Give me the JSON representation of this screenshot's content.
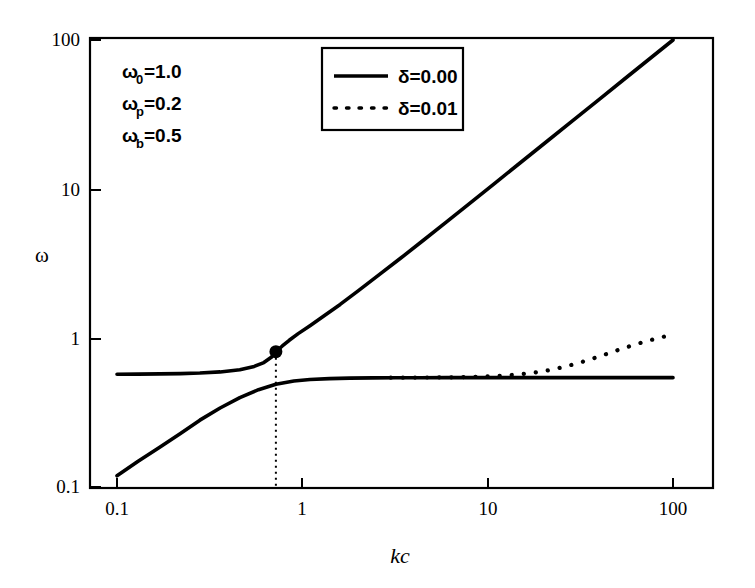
{
  "chart_data": {
    "type": "line",
    "title": "",
    "xlabel": "kc",
    "ylabel": "ω",
    "xscale": "log",
    "yscale": "log",
    "xlim": [
      0.1,
      100
    ],
    "ylim": [
      0.1,
      100
    ],
    "xticks": [
      "0.1",
      "1",
      "10",
      "100"
    ],
    "xtick_values": [
      0.1,
      1,
      10,
      100
    ],
    "yticks": [
      "0.1",
      "1",
      "10",
      "100"
    ],
    "ytick_values": [
      0.1,
      1,
      10,
      100
    ],
    "grid": false,
    "legend_position": "top-center",
    "annotations": {
      "omega_0": "ω₀=1.0",
      "omega_p": "ωₚ=0.2",
      "omega_b": "ωᵇ=0.5",
      "omega_0_base": "ω",
      "omega_0_sub": "0",
      "omega_0_val": "=1.0",
      "omega_p_base": "ω",
      "omega_p_sub": "p",
      "omega_p_val": "=0.2",
      "omega_b_base": "ω",
      "omega_b_sub": "b",
      "omega_b_val": "=0.5"
    },
    "marker_point": {
      "x": 0.72,
      "y": 0.81,
      "label": "anticrossing-point"
    },
    "dropline": {
      "x": 0.72,
      "y_from": 0.81,
      "y_to": 0.1,
      "style": "dotted"
    },
    "series": [
      {
        "name": "δ=0.00",
        "style": "solid",
        "color": "#000000",
        "branch": "upper-polariton",
        "x": [
          0.1,
          0.13,
          0.17,
          0.22,
          0.28,
          0.36,
          0.46,
          0.55,
          0.62,
          0.68,
          0.72,
          0.78,
          0.85,
          0.95,
          1.1,
          1.3,
          1.6,
          2.0,
          2.6,
          3.4,
          4.5,
          6.0,
          8.0,
          11,
          15,
          21,
          29,
          40,
          56,
          76,
          100
        ],
        "y": [
          0.571,
          0.572,
          0.574,
          0.577,
          0.582,
          0.592,
          0.612,
          0.645,
          0.684,
          0.742,
          0.81,
          0.884,
          0.965,
          1.07,
          1.21,
          1.4,
          1.68,
          2.07,
          2.66,
          3.44,
          4.53,
          6.02,
          8.02,
          11.0,
          15.0,
          21.0,
          29.0,
          40.0,
          56.0,
          76.0,
          100.0
        ]
      },
      {
        "name": "δ=0.00",
        "style": "solid",
        "color": "#000000",
        "branch": "lower-polariton",
        "x": [
          0.1,
          0.13,
          0.17,
          0.22,
          0.28,
          0.36,
          0.46,
          0.58,
          0.72,
          0.9,
          1.1,
          1.4,
          1.8,
          2.4,
          3.2,
          4.3,
          6.0,
          8.5,
          12,
          18,
          26,
          38,
          56,
          76,
          100
        ],
        "y": [
          0.119,
          0.149,
          0.185,
          0.229,
          0.281,
          0.339,
          0.398,
          0.45,
          0.489,
          0.514,
          0.527,
          0.534,
          0.538,
          0.54,
          0.541,
          0.541,
          0.542,
          0.542,
          0.542,
          0.542,
          0.542,
          0.542,
          0.542,
          0.542,
          0.542
        ]
      },
      {
        "name": "δ=0.01",
        "style": "dotted",
        "color": "#000000",
        "branch": "lower-polariton-damped",
        "x": [
          3.0,
          3.6,
          4.3,
          5.1,
          6.1,
          7.3,
          8.7,
          10.4,
          12.4,
          14.8,
          17.7,
          21.1,
          25.2,
          30.1,
          36.0,
          43.0,
          51.3,
          61.3,
          73.2,
          87.4,
          100.0
        ],
        "y": [
          0.542,
          0.542,
          0.543,
          0.543,
          0.544,
          0.546,
          0.549,
          0.553,
          0.56,
          0.57,
          0.585,
          0.606,
          0.635,
          0.673,
          0.72,
          0.775,
          0.835,
          0.898,
          0.958,
          1.015,
          1.05
        ]
      }
    ],
    "legend": [
      {
        "label": "δ=0.00",
        "style": "solid"
      },
      {
        "label": "δ=0.01",
        "style": "dotted"
      }
    ]
  }
}
